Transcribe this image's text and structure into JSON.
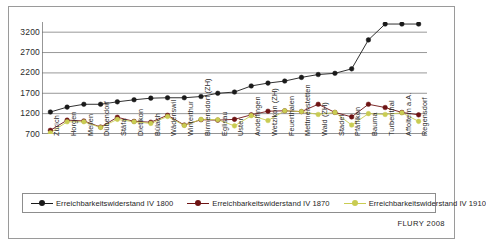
{
  "credit": "FLURY 2008",
  "chart_data": {
    "type": "line",
    "title": "",
    "xlabel": "",
    "ylabel": "",
    "ylim": [
      700,
      3450
    ],
    "yticks": [
      700,
      1200,
      1700,
      2200,
      2700,
      3200
    ],
    "grid": true,
    "legend_position": "bottom",
    "categories": [
      "Zürich",
      "Horgen",
      "Meilen",
      "Dübendorf",
      "Stäfa",
      "Dietikon",
      "Bülach",
      "Wädenswil",
      "Winterthur",
      "Birmensdorf (ZH)",
      "Eglisau",
      "Uster",
      "Andelfingen",
      "Wetzikon (ZH)",
      "Feuerthalen",
      "Mettmenstetten",
      "Wald (ZH)",
      "Stadel",
      "Pfäffikon",
      "Bauma",
      "Turbenthal",
      "Affoltern a.A.",
      "Regensdorf"
    ],
    "series": [
      {
        "name": "Erreichbarkeitswiderstand IV 1800",
        "color": "#1a1a1a",
        "values": [
          1240,
          1360,
          1430,
          1430,
          1490,
          1540,
          1580,
          1590,
          1590,
          1620,
          1700,
          1730,
          1880,
          1950,
          2000,
          2090,
          2160,
          2190,
          2300,
          3010,
          3400,
          3400,
          3400
        ]
      },
      {
        "name": "Erreichbarkeitswiderstand IV 1870",
        "color": "#6e1414",
        "values": [
          790,
          1040,
          1020,
          870,
          1110,
          1010,
          990,
          1160,
          920,
          1050,
          1040,
          1060,
          1170,
          1260,
          1270,
          1250,
          1430,
          1230,
          1120,
          1430,
          1350,
          1230,
          1170
        ]
      },
      {
        "name": "Erreichbarkeitswiderstand IV 1910",
        "color": "#c9cc52",
        "values": [
          730,
          1000,
          1000,
          860,
          1060,
          1000,
          960,
          1130,
          910,
          1060,
          1050,
          900,
          1150,
          1030,
          1270,
          1250,
          1180,
          1230,
          920,
          1200,
          1180,
          1220,
          1010
        ]
      }
    ]
  }
}
